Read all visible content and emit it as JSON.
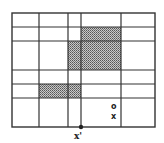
{
  "diagram": {
    "type": "grid-partition",
    "grid": {
      "outer": {
        "x": 12,
        "y": 13,
        "w": 143,
        "h": 114
      },
      "vlines": [
        39,
        68,
        81,
        121
      ],
      "hlines": [
        27,
        41,
        70,
        84,
        98
      ],
      "line_color": "#333333"
    },
    "shaded_regions": [
      {
        "x": 81,
        "y": 27,
        "w": 40,
        "h": 14
      },
      {
        "x": 68,
        "y": 41,
        "w": 53,
        "h": 29
      },
      {
        "x": 39,
        "y": 84,
        "w": 42,
        "h": 14
      }
    ],
    "shade_color": "#9a9a9a",
    "points": [
      {
        "name": "query-point",
        "x": 81,
        "y": 127,
        "marker": "dot"
      },
      {
        "name": "circle-point",
        "x": 114,
        "y": 106,
        "marker": "o"
      },
      {
        "name": "cross-point",
        "x": 115,
        "y": 116,
        "marker": "x"
      }
    ],
    "labels": {
      "query_label": "x'",
      "circle_marker": "o",
      "cross_marker": "x"
    }
  }
}
